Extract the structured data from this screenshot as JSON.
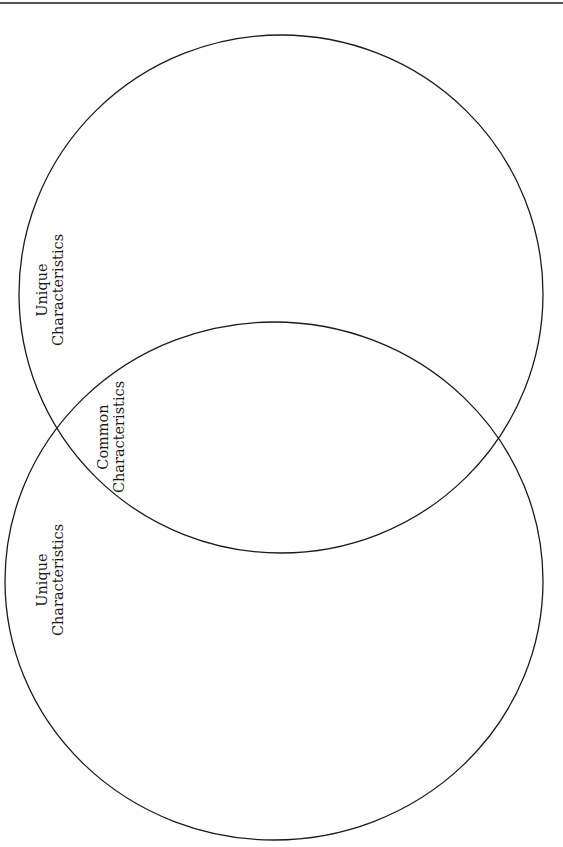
{
  "diagram": {
    "type": "venn",
    "colors": {
      "stroke": "#1a1a1a",
      "rule": "#555555",
      "background": "#ffffff"
    },
    "circles": [
      {
        "id": "top",
        "label_line1": "Unique",
        "label_line2": "Characteristics"
      },
      {
        "id": "bottom",
        "label_line1": "Unique",
        "label_line2": "Characteristics"
      }
    ],
    "intersection": {
      "label_line1": "Common",
      "label_line2": "Characteristics"
    }
  }
}
